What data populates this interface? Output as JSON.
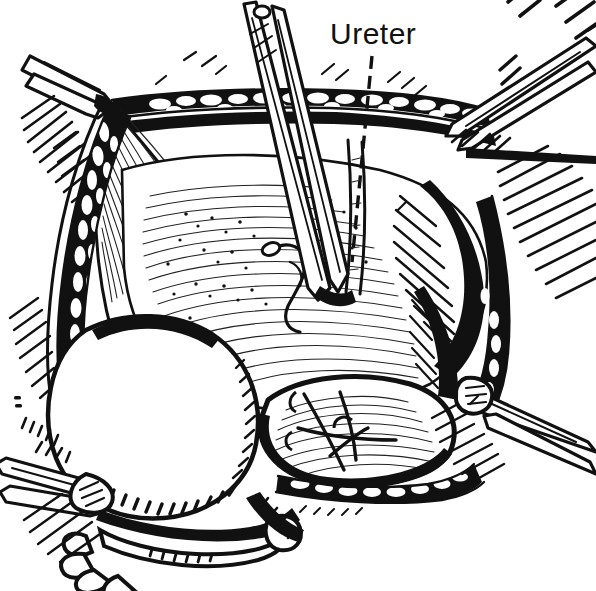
{
  "figure": {
    "kind": "surgical-line-illustration",
    "medium": "pen-and-ink hatching engraving",
    "width": 596,
    "height": 591,
    "background_color": "#ffffff",
    "ink_color": "#111111"
  },
  "labels": [
    {
      "id": "ureter",
      "text": "Ureter",
      "x": 330,
      "y": 44,
      "font_size": 30,
      "leader": {
        "style": "dashed",
        "from_x": 372,
        "from_y": 56,
        "to_x": 352,
        "to_y": 262
      }
    }
  ],
  "instruments": [
    {
      "name": "upper-left-clamp",
      "type": "hemostat-clamp",
      "grip_x": 112,
      "grip_y": 106
    },
    {
      "name": "center-forceps",
      "type": "long-dissecting-forceps",
      "tip_x": 330,
      "tip_y": 300
    },
    {
      "name": "upper-right-clamp",
      "type": "hemostat-clamp",
      "grip_x": 444,
      "grip_y": 124
    },
    {
      "name": "lower-right-clamp",
      "type": "hemostat-clamp",
      "grip_x": 478,
      "grip_y": 392
    },
    {
      "name": "lower-left-retractor",
      "type": "retractor-blade",
      "grip_x": 86,
      "grip_y": 470
    }
  ],
  "anatomy": [
    {
      "name": "wound-edge-fat-upper",
      "description": "lobulated subcutaneous fat band along upper incision edge"
    },
    {
      "name": "wound-edge-fat-left",
      "description": "lobulated fat band along left incision edge"
    },
    {
      "name": "wound-edge-fat-lower-right",
      "description": "lobulated fat band along lower right incision edge"
    },
    {
      "name": "peritoneal-flap",
      "description": "reflected peritoneal flap retracted to the left"
    },
    {
      "name": "pelvic-floor-tissue",
      "description": "stippled and hatched pelvic floor tissue mass in center"
    },
    {
      "name": "bladder-dome",
      "description": "pale bladder dome in lower left of the field"
    },
    {
      "name": "sutured-stump",
      "description": "sutured and ligated structure in lower center"
    },
    {
      "name": "ureter-course",
      "description": "ureter coursing vertically beneath the forceps"
    }
  ]
}
